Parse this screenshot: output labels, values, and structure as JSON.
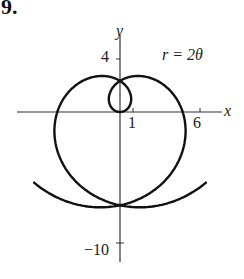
{
  "problem_number": "9.",
  "equation_label": "r = 2θ",
  "axes": {
    "x_label": "x",
    "y_label": "y",
    "x_ticks": [
      {
        "value": 1,
        "label": "1"
      },
      {
        "value": 6,
        "label": "6"
      }
    ],
    "y_ticks": [
      {
        "value": 4,
        "label": "4"
      },
      {
        "value": -10,
        "label": "−10"
      }
    ]
  },
  "curve": {
    "type": "polar",
    "equation": "r = 2θ",
    "theta_range": [
      -5.6,
      5.6
    ]
  },
  "colors": {
    "curve": "#111111",
    "axis": "#333333"
  }
}
